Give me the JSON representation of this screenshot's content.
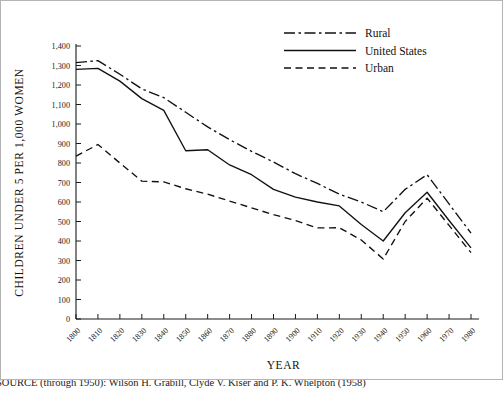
{
  "figure": {
    "source_note": "SOURCE (through 1950): Wilson H. Grabill, Clyde V. Kiser and P. K. Whelpton (1958)"
  },
  "chart_data": {
    "type": "line",
    "title": "",
    "xlabel": "YEAR",
    "ylabel": "CHILDREN UNDER 5 PER 1,000 WOMEN",
    "xlim": [
      1800,
      1980
    ],
    "ylim": [
      0,
      1400
    ],
    "ytick_step": 100,
    "grid": false,
    "legend_position": "top-right",
    "categories": [
      1800,
      1810,
      1820,
      1830,
      1840,
      1850,
      1860,
      1870,
      1880,
      1890,
      1900,
      1910,
      1920,
      1930,
      1940,
      1950,
      1960,
      1970,
      1980
    ],
    "xtick_labels": [
      "1800",
      "1810",
      "1820",
      "1830",
      "1840",
      "1850",
      "1860",
      "1870",
      "1880",
      "1890",
      "1900",
      "1910",
      "1920",
      "1930",
      "1940",
      "1950",
      "1960",
      "1970",
      "1980"
    ],
    "ytick_labels": [
      "0",
      "100",
      "200",
      "300",
      "400",
      "500",
      "600",
      "700",
      "800",
      "900",
      "1,000",
      "1,100",
      "1,200",
      "1,300",
      "1,400"
    ],
    "series": [
      {
        "name": "Rural",
        "style": "dashdot",
        "dasharray": "11,3.5,2.5,3.5",
        "values": [
          1315,
          1325,
          1255,
          1180,
          1135,
          1060,
          985,
          920,
          860,
          805,
          745,
          695,
          640,
          600,
          550,
          665,
          740,
          590,
          440
        ]
      },
      {
        "name": "United States",
        "style": "solid",
        "dasharray": "",
        "values": [
          1280,
          1285,
          1220,
          1130,
          1070,
          863,
          868,
          790,
          740,
          665,
          625,
          600,
          580,
          485,
          400,
          545,
          650,
          505,
          365
        ]
      },
      {
        "name": "Urban",
        "style": "dashed",
        "dasharray": "7,4.5",
        "values": [
          835,
          895,
          800,
          707,
          703,
          668,
          640,
          605,
          570,
          535,
          505,
          467,
          468,
          405,
          308,
          500,
          620,
          480,
          340
        ]
      }
    ]
  },
  "legend": {
    "items": [
      {
        "label": "Rural"
      },
      {
        "label": "United States"
      },
      {
        "label": "Urban"
      }
    ]
  }
}
